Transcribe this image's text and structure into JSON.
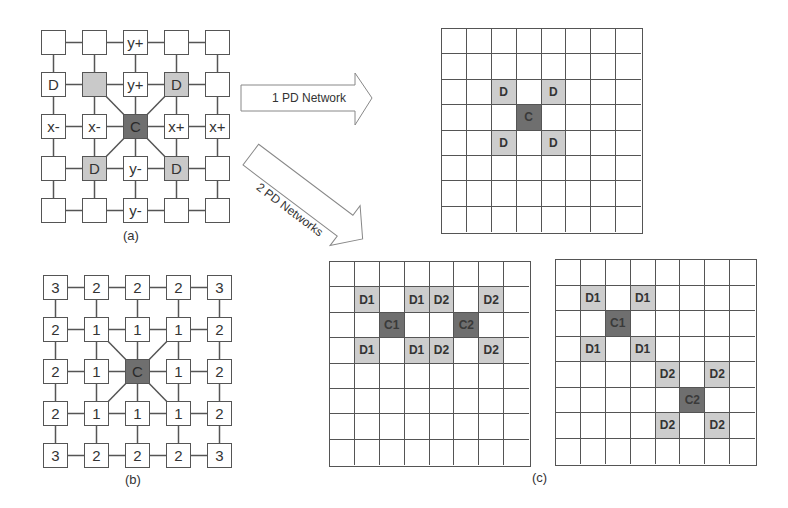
{
  "figure": {
    "panel_a": {
      "caption": "(a)",
      "origin": [
        41,
        30
      ],
      "spacing": [
        41,
        42
      ],
      "nodes": [
        [
          "",
          "",
          "y+",
          "",
          ""
        ],
        [
          "D",
          "",
          "y+",
          "D",
          ""
        ],
        [
          "x-",
          "x-",
          "C",
          "x+",
          "x+"
        ],
        [
          "",
          "D",
          "y-",
          "D",
          ""
        ],
        [
          "",
          "",
          "y-",
          "",
          ""
        ]
      ],
      "styles": [
        [
          "n",
          "n",
          "n",
          "n",
          "n"
        ],
        [
          "n",
          "d",
          "n",
          "d",
          "n"
        ],
        [
          "n",
          "n",
          "c",
          "n",
          "n"
        ],
        [
          "n",
          "d",
          "n",
          "d",
          "n"
        ],
        [
          "n",
          "n",
          "n",
          "n",
          "n"
        ]
      ]
    },
    "panel_b": {
      "caption": "(b)",
      "origin": [
        43,
        275
      ],
      "spacing": [
        41,
        42
      ],
      "nodes": [
        [
          "3",
          "2",
          "2",
          "2",
          "3"
        ],
        [
          "2",
          "1",
          "1",
          "1",
          "2"
        ],
        [
          "2",
          "1",
          "C",
          "1",
          "2"
        ],
        [
          "2",
          "1",
          "1",
          "1",
          "2"
        ],
        [
          "3",
          "2",
          "2",
          "2",
          "3"
        ]
      ],
      "styles": [
        [
          "n",
          "n",
          "n",
          "n",
          "n"
        ],
        [
          "n",
          "n",
          "n",
          "n",
          "n"
        ],
        [
          "n",
          "n",
          "c",
          "n",
          "n"
        ],
        [
          "n",
          "n",
          "n",
          "n",
          "n"
        ],
        [
          "n",
          "n",
          "n",
          "n",
          "n"
        ]
      ]
    },
    "arrows": [
      {
        "label": "1 PD Network"
      },
      {
        "label": "2 PD Networks"
      }
    ],
    "panel_c": {
      "caption": "(c)",
      "grids": [
        {
          "name": "one-pd-network-grid",
          "box": [
            441,
            28,
            202,
            206
          ],
          "size": 8,
          "cells": [
            {
              "r": 2,
              "c": 2,
              "label": "D",
              "type": "d"
            },
            {
              "r": 2,
              "c": 4,
              "label": "D",
              "type": "d"
            },
            {
              "r": 3,
              "c": 3,
              "label": "C",
              "type": "c"
            },
            {
              "r": 4,
              "c": 2,
              "label": "D",
              "type": "d"
            },
            {
              "r": 4,
              "c": 4,
              "label": "D",
              "type": "d"
            }
          ]
        },
        {
          "name": "two-pd-networks-adjacent-grid",
          "box": [
            329,
            261,
            202,
            206
          ],
          "size": 8,
          "cells": [
            {
              "r": 1,
              "c": 1,
              "label": "D1",
              "type": "d"
            },
            {
              "r": 1,
              "c": 3,
              "label": "D1",
              "type": "d"
            },
            {
              "r": 1,
              "c": 4,
              "label": "D2",
              "type": "d"
            },
            {
              "r": 1,
              "c": 6,
              "label": "D2",
              "type": "d"
            },
            {
              "r": 2,
              "c": 2,
              "label": "C1",
              "type": "c"
            },
            {
              "r": 2,
              "c": 5,
              "label": "C2",
              "type": "c"
            },
            {
              "r": 3,
              "c": 1,
              "label": "D1",
              "type": "d"
            },
            {
              "r": 3,
              "c": 3,
              "label": "D1",
              "type": "d"
            },
            {
              "r": 3,
              "c": 4,
              "label": "D2",
              "type": "d"
            },
            {
              "r": 3,
              "c": 6,
              "label": "D2",
              "type": "d"
            }
          ]
        },
        {
          "name": "two-pd-networks-diagonal-grid",
          "box": [
            555,
            259,
            202,
            207
          ],
          "size": 8,
          "cells": [
            {
              "r": 1,
              "c": 1,
              "label": "D1",
              "type": "d"
            },
            {
              "r": 1,
              "c": 3,
              "label": "D1",
              "type": "d"
            },
            {
              "r": 2,
              "c": 2,
              "label": "C1",
              "type": "c"
            },
            {
              "r": 3,
              "c": 1,
              "label": "D1",
              "type": "d"
            },
            {
              "r": 3,
              "c": 3,
              "label": "D1",
              "type": "d"
            },
            {
              "r": 4,
              "c": 4,
              "label": "D2",
              "type": "d"
            },
            {
              "r": 4,
              "c": 6,
              "label": "D2",
              "type": "d"
            },
            {
              "r": 5,
              "c": 5,
              "label": "C2",
              "type": "c"
            },
            {
              "r": 6,
              "c": 4,
              "label": "D2",
              "type": "d"
            },
            {
              "r": 6,
              "c": 6,
              "label": "D2",
              "type": "d"
            }
          ]
        }
      ]
    }
  }
}
